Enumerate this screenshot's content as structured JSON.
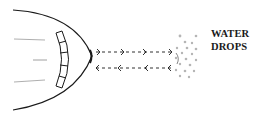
{
  "diagram": {
    "label": {
      "line1": "WATER",
      "line2": "DROPS"
    },
    "elements": [
      {
        "name": "radome",
        "description": "aircraft nose cone outline"
      },
      {
        "name": "radar-antenna",
        "description": "segmented curved antenna dish inside nose"
      },
      {
        "name": "outgoing-signal",
        "direction": "right",
        "count": 1
      },
      {
        "name": "return-signal",
        "direction": "left",
        "count": 1
      },
      {
        "name": "water-drops",
        "description": "cluster of droplets"
      }
    ],
    "colors": {
      "stroke": "#1a1a1a",
      "drops": "#9a9a9a",
      "background": "#ffffff"
    }
  }
}
